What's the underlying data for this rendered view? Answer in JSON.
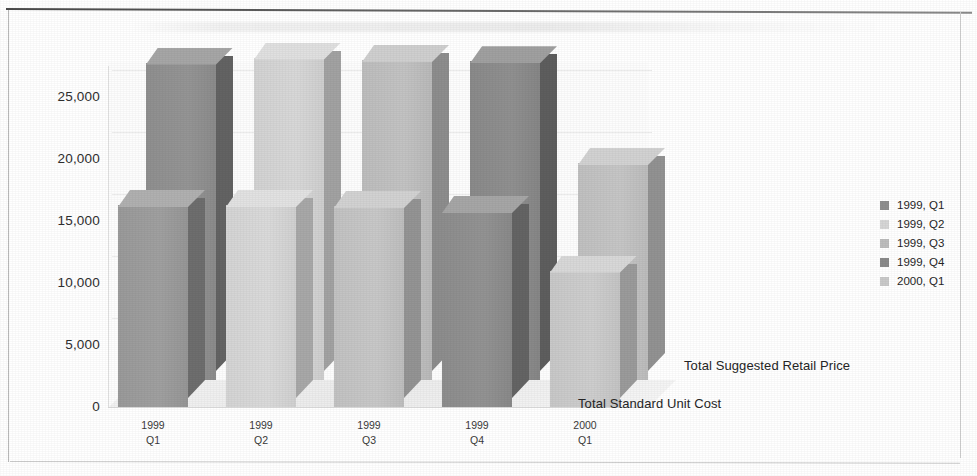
{
  "chart_data": {
    "type": "bar",
    "subtype": "3d-clustered-column",
    "title": "",
    "xlabel": "",
    "ylabel": "",
    "ylim": [
      0,
      27500
    ],
    "grid": true,
    "legend_position": "right",
    "categories": [
      "1999 Q1",
      "1999 Q2",
      "1999 Q3",
      "1999 Q4",
      "2000 Q1"
    ],
    "category_lines": [
      {
        "line1": "1999",
        "line2": "Q1"
      },
      {
        "line1": "1999",
        "line2": "Q2"
      },
      {
        "line1": "1999",
        "line2": "Q3"
      },
      {
        "line1": "1999",
        "line2": "Q4"
      },
      {
        "line1": "2000",
        "line2": "Q1"
      }
    ],
    "yticks": [
      "0",
      "5,000",
      "10,000",
      "15,000",
      "20,000",
      "25,000"
    ],
    "ytick_values": [
      0,
      5000,
      10000,
      15000,
      20000,
      25000
    ],
    "series": [
      {
        "name": "Total Suggested Retail Price",
        "depth_index": 0,
        "values": [
          25600,
          26000,
          25800,
          25700,
          17500
        ]
      },
      {
        "name": "Total Standard Unit Cost",
        "depth_index": 1,
        "values": [
          16300,
          16300,
          16200,
          15800,
          11000
        ]
      }
    ],
    "legend": [
      {
        "label": "1999, Q1",
        "color": "#8f8f8f"
      },
      {
        "label": "1999, Q2",
        "color": "#d6d6d6"
      },
      {
        "label": "1999, Q3",
        "color": "#bdbdbd"
      },
      {
        "label": "1999, Q4",
        "color": "#8a8a8a"
      },
      {
        "label": "2000, Q1",
        "color": "#c9c9c9"
      }
    ],
    "bar_colors": [
      "#9a9a9a",
      "#d4d4d4",
      "#c2c2c2",
      "#8d8d8d",
      "#c8c8c8"
    ],
    "bar_side_colors": [
      "#6e6e6e",
      "#a8a8a8",
      "#949494",
      "#646464",
      "#9b9b9b"
    ],
    "bar_top_colors": [
      "#b0b0b0",
      "#e2e2e2",
      "#d2d2d2",
      "#a6a6a6",
      "#d8d8d8"
    ],
    "back_row_colors": [
      "#8f8f8f",
      "#d2d2d2",
      "#bdbdbd",
      "#8a8a8a",
      "#c0c0c0"
    ],
    "back_row_side_colors": [
      "#636363",
      "#a2a2a2",
      "#8d8d8d",
      "#5e5e5e",
      "#929292"
    ],
    "back_row_top_colors": [
      "#a6a6a6",
      "#e0e0e0",
      "#cfcfcf",
      "#a0a0a0",
      "#d2d2d2"
    ]
  },
  "zaxis_labels": {
    "back": "Total Suggested Retail Price",
    "front": "Total Standard Unit Cost"
  }
}
